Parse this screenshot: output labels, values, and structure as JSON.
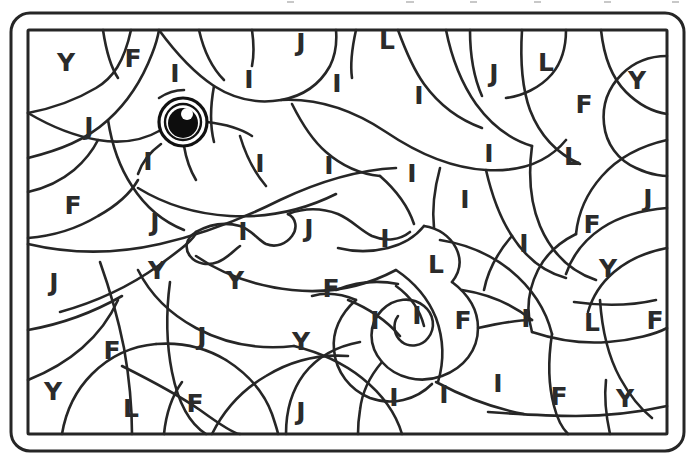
{
  "page": {
    "kind": "color-by-letter-coloring-page",
    "background_color": "#ffffff",
    "ink_color": "#2b2b2b",
    "line_color": "#262626",
    "frame": {
      "outer_border_label": "outer-rounded-frame",
      "inner_border_label": "inner-rectangular-frame",
      "outer_radius_px": 18,
      "stroke_px": 3
    },
    "eye": {
      "label": "chameleon-eye",
      "pupil_color": "#0d0d0d",
      "highlight_color": "#ffffff",
      "ring_color": "#111111",
      "cx": 183,
      "cy": 122,
      "r_outer": 24,
      "r_inner": 18,
      "pupil_r": 15,
      "highlight_cx": 187,
      "highlight_cy": 114,
      "highlight_r": 6
    }
  },
  "legend_letters": [
    "Y",
    "F",
    "I",
    "J",
    "L"
  ],
  "letters": [
    {
      "char": "Y",
      "x": 66,
      "y": 62
    },
    {
      "char": "F",
      "x": 133,
      "y": 58
    },
    {
      "char": "I",
      "x": 175,
      "y": 73
    },
    {
      "char": "I",
      "x": 249,
      "y": 79
    },
    {
      "char": "J",
      "x": 301,
      "y": 42
    },
    {
      "char": "I",
      "x": 337,
      "y": 83
    },
    {
      "char": "L",
      "x": 387,
      "y": 40
    },
    {
      "char": "I",
      "x": 419,
      "y": 95
    },
    {
      "char": "J",
      "x": 494,
      "y": 73
    },
    {
      "char": "L",
      "x": 546,
      "y": 62
    },
    {
      "char": "F",
      "x": 584,
      "y": 104
    },
    {
      "char": "Y",
      "x": 637,
      "y": 80
    },
    {
      "char": "J",
      "x": 89,
      "y": 126
    },
    {
      "char": "I",
      "x": 489,
      "y": 153
    },
    {
      "char": "L",
      "x": 572,
      "y": 156
    },
    {
      "char": "I",
      "x": 148,
      "y": 161
    },
    {
      "char": "I",
      "x": 260,
      "y": 163
    },
    {
      "char": "I",
      "x": 329,
      "y": 165
    },
    {
      "char": "I",
      "x": 412,
      "y": 173
    },
    {
      "char": "F",
      "x": 73,
      "y": 205
    },
    {
      "char": "J",
      "x": 155,
      "y": 222
    },
    {
      "char": "I",
      "x": 243,
      "y": 231
    },
    {
      "char": "J",
      "x": 309,
      "y": 228
    },
    {
      "char": "I",
      "x": 385,
      "y": 238
    },
    {
      "char": "I",
      "x": 465,
      "y": 199
    },
    {
      "char": "F",
      "x": 592,
      "y": 224
    },
    {
      "char": "J",
      "x": 648,
      "y": 198
    },
    {
      "char": "I",
      "x": 524,
      "y": 243
    },
    {
      "char": "J",
      "x": 54,
      "y": 282
    },
    {
      "char": "Y",
      "x": 157,
      "y": 270
    },
    {
      "char": "Y",
      "x": 235,
      "y": 280
    },
    {
      "char": "F",
      "x": 331,
      "y": 288
    },
    {
      "char": "L",
      "x": 436,
      "y": 264
    },
    {
      "char": "F",
      "x": 112,
      "y": 350
    },
    {
      "char": "J",
      "x": 202,
      "y": 336
    },
    {
      "char": "Y",
      "x": 301,
      "y": 341
    },
    {
      "char": "I",
      "x": 375,
      "y": 320
    },
    {
      "char": "I",
      "x": 417,
      "y": 315
    },
    {
      "char": "F",
      "x": 463,
      "y": 320
    },
    {
      "char": "I",
      "x": 526,
      "y": 318
    },
    {
      "char": "L",
      "x": 592,
      "y": 322
    },
    {
      "char": "F",
      "x": 655,
      "y": 320
    },
    {
      "char": "Y",
      "x": 608,
      "y": 268
    },
    {
      "char": "Y",
      "x": 53,
      "y": 391
    },
    {
      "char": "L",
      "x": 131,
      "y": 408
    },
    {
      "char": "F",
      "x": 195,
      "y": 403
    },
    {
      "char": "J",
      "x": 301,
      "y": 411
    },
    {
      "char": "I",
      "x": 394,
      "y": 397
    },
    {
      "char": "I",
      "x": 444,
      "y": 394
    },
    {
      "char": "I",
      "x": 498,
      "y": 383
    },
    {
      "char": "F",
      "x": 559,
      "y": 396
    },
    {
      "char": "Y",
      "x": 625,
      "y": 398
    }
  ]
}
